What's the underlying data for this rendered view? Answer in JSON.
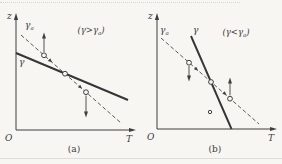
{
  "colors": {
    "background": "#f7f6f2",
    "line": "#3f3f3f",
    "text": "#3a3a3a"
  },
  "panel_a": {
    "z_axis_label": "z",
    "origin_label": "O",
    "t_axis_label": "T",
    "gamma_label": "γ",
    "gamma_a_label": {
      "base": "γ",
      "sub": "a"
    },
    "condition": {
      "pre": "(γ>γ",
      "sub": "a",
      "post": ")"
    },
    "caption": "(a)"
  },
  "panel_b": {
    "z_axis_label": "z",
    "origin_label": "O",
    "t_axis_label": "T",
    "gamma_label": "γ",
    "gamma_a_label": {
      "base": "γ",
      "sub": "a"
    },
    "condition": {
      "pre": "(γ<γ",
      "sub": "a",
      "post": ")"
    },
    "caption": "(b)"
  }
}
